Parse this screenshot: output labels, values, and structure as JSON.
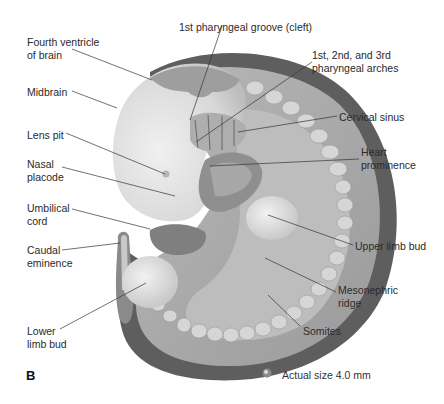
{
  "figure": {
    "panel_label": "B",
    "scale_note": "Actual size 4.0 mm",
    "scale_icon": "embryo-miniature-icon",
    "labels": [
      {
        "id": "fourth-ventricle",
        "text": "Fourth ventricle\nof brain",
        "x": 27,
        "y": 36
      },
      {
        "id": "first-pharyngeal-groove",
        "text": "1st pharyngeal groove (cleft)",
        "x": 179,
        "y": 21
      },
      {
        "id": "pharyngeal-arches",
        "text": "1st, 2nd, and 3rd\npharyngeal arches",
        "x": 312,
        "y": 49
      },
      {
        "id": "midbrain",
        "text": "Midbrain",
        "x": 27,
        "y": 86
      },
      {
        "id": "cervical-sinus",
        "text": "Cervical sinus",
        "x": 339,
        "y": 111
      },
      {
        "id": "lens-pit",
        "text": "Lens pit",
        "x": 27,
        "y": 129
      },
      {
        "id": "heart-prominence",
        "text": "Heart\nprominence",
        "x": 361,
        "y": 146
      },
      {
        "id": "nasal-placode",
        "text": "Nasal\nplacode",
        "x": 27,
        "y": 158
      },
      {
        "id": "umbilical-cord",
        "text": "Umbilical\ncord",
        "x": 27,
        "y": 202
      },
      {
        "id": "upper-limb-bud",
        "text": "Upper limb bud",
        "x": 355,
        "y": 240
      },
      {
        "id": "caudal-eminence",
        "text": "Caudal\neminence",
        "x": 27,
        "y": 244
      },
      {
        "id": "mesonephric-ridge",
        "text": "Mesonephric\nridge",
        "x": 338,
        "y": 284
      },
      {
        "id": "somites",
        "text": "Somites",
        "x": 303,
        "y": 325
      },
      {
        "id": "lower-limb-bud",
        "text": "Lower\nlimb bud",
        "x": 27,
        "y": 325
      }
    ]
  },
  "colors": {
    "background": "#ffffff",
    "outer_rim": "#5e5e5e",
    "body_mid": "#9a9a9a",
    "body_light": "#cfcfcf",
    "head_light": "#e2e2e2",
    "somite": "#d6d6d6",
    "leader_line": "#333333",
    "text": "#2a2a2a"
  }
}
